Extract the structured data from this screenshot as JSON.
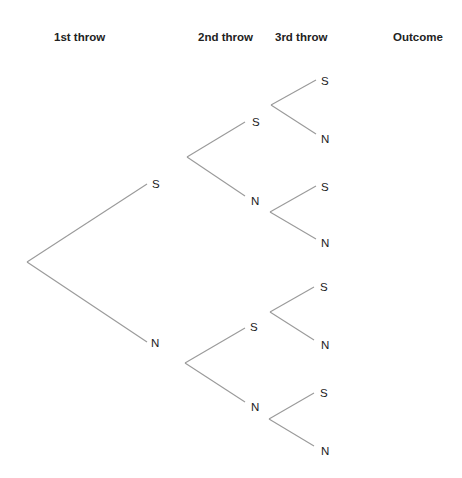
{
  "headers": {
    "first": "1st throw",
    "second": "2nd throw",
    "third": "3rd throw",
    "outcome": "Outcome"
  },
  "colors": {
    "line": "#9a9a9a",
    "text": "#222222",
    "background": "#ffffff"
  },
  "tree": {
    "root": {
      "x": 27,
      "y": 262
    },
    "level1": [
      {
        "label": "S",
        "end": {
          "x": 147,
          "y": 184
        },
        "label_pos": {
          "x": 152,
          "y": 184
        }
      },
      {
        "label": "N",
        "end": {
          "x": 147,
          "y": 342
        },
        "label_pos": {
          "x": 151,
          "y": 343
        }
      }
    ],
    "level2": [
      {
        "from": {
          "x": 187,
          "y": 157
        },
        "branches": [
          {
            "label": "S",
            "end": {
              "x": 245,
              "y": 122
            },
            "label_pos": {
              "x": 252,
              "y": 122
            }
          },
          {
            "label": "N",
            "end": {
              "x": 245,
              "y": 196
            },
            "label_pos": {
              "x": 251,
              "y": 201
            }
          }
        ]
      },
      {
        "from": {
          "x": 185,
          "y": 363
        },
        "branches": [
          {
            "label": "S",
            "end": {
              "x": 245,
              "y": 328
            },
            "label_pos": {
              "x": 250,
              "y": 327
            }
          },
          {
            "label": "N",
            "end": {
              "x": 245,
              "y": 402
            },
            "label_pos": {
              "x": 251,
              "y": 407
            }
          }
        ]
      }
    ],
    "level3": [
      {
        "from": {
          "x": 271,
          "y": 105
        },
        "branches": [
          {
            "label": "S",
            "end": {
              "x": 316,
              "y": 80
            },
            "label_pos": {
              "x": 321,
              "y": 81
            }
          },
          {
            "label": "N",
            "end": {
              "x": 316,
              "y": 134
            },
            "label_pos": {
              "x": 321,
              "y": 139
            }
          }
        ]
      },
      {
        "from": {
          "x": 270,
          "y": 212
        },
        "branches": [
          {
            "label": "S",
            "end": {
              "x": 316,
              "y": 186
            },
            "label_pos": {
              "x": 321,
              "y": 187
            }
          },
          {
            "label": "N",
            "end": {
              "x": 316,
              "y": 239
            },
            "label_pos": {
              "x": 321,
              "y": 243
            }
          }
        ]
      },
      {
        "from": {
          "x": 270,
          "y": 312
        },
        "branches": [
          {
            "label": "S",
            "end": {
              "x": 314,
              "y": 287
            },
            "label_pos": {
              "x": 320,
              "y": 287
            }
          },
          {
            "label": "N",
            "end": {
              "x": 314,
              "y": 340
            },
            "label_pos": {
              "x": 321,
              "y": 345
            }
          }
        ]
      },
      {
        "from": {
          "x": 269,
          "y": 419
        },
        "branches": [
          {
            "label": "S",
            "end": {
              "x": 314,
              "y": 393
            },
            "label_pos": {
              "x": 320,
              "y": 393
            }
          },
          {
            "label": "N",
            "end": {
              "x": 314,
              "y": 446
            },
            "label_pos": {
              "x": 321,
              "y": 451
            }
          }
        ]
      }
    ],
    "outcomes": []
  }
}
